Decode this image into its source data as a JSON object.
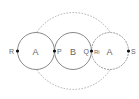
{
  "diagram": {
    "circles": [
      {
        "label": "A",
        "cx": 36,
        "cy": 51,
        "r": 18.5,
        "style": "solid"
      },
      {
        "label": "B",
        "cx": 73,
        "cy": 51,
        "r": 18.5,
        "style": "solid"
      },
      {
        "label": "A",
        "cx": 110,
        "cy": 51,
        "r": 18.5,
        "style": "solid-dashed"
      }
    ],
    "outer_circle": {
      "cx": 73,
      "cy": 51,
      "r": 44,
      "style": "dashed"
    },
    "points": [
      {
        "label": "R",
        "x": 17,
        "y": 51
      },
      {
        "label": "P",
        "x": 54.5,
        "y": 51
      },
      {
        "label": "Q",
        "x": 91.5,
        "y": 51
      },
      {
        "label": "S",
        "x": 129,
        "y": 51
      }
    ],
    "point_labels": {
      "R": "R",
      "P": "P",
      "Q": "Q",
      "Ri": "Ri",
      "S": "S"
    },
    "circle_labels": {
      "left": "A",
      "middle": "B",
      "right": "A"
    },
    "colors": {
      "stroke": "#888888",
      "dashed": "#aaaaaa",
      "point": "#111111",
      "text": "#666666"
    }
  }
}
